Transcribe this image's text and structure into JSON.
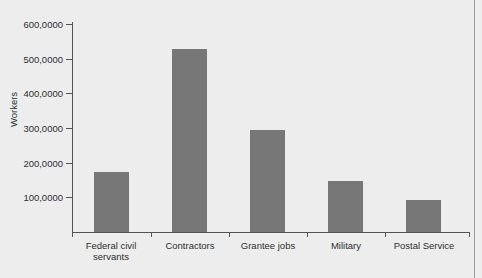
{
  "figure": {
    "background_color": "#ededed",
    "bar_color": "#777777",
    "axis_color": "#555555",
    "clipped_title": "g"
  },
  "axes": {
    "ylabel": "Workers",
    "xlabel": "",
    "ytick_labels": [
      "100,0000",
      "200,0000",
      "300,0000",
      "400,0000",
      "500,0000",
      "600,0000"
    ]
  },
  "chart_data": {
    "type": "bar",
    "title": "",
    "xlabel": "",
    "ylabel": "Workers",
    "categories": [
      "Federal civil servants",
      "Contractors",
      "Grantee jobs",
      "Military",
      "Postal Service"
    ],
    "values": [
      173000,
      527000,
      294000,
      147000,
      92000
    ],
    "ylim": [
      0,
      600000
    ],
    "ytick_values": [
      100000,
      200000,
      300000,
      400000,
      500000,
      600000
    ],
    "ytick_labels": [
      "100,0000",
      "200,0000",
      "300,0000",
      "400,0000",
      "500,0000",
      "600,0000"
    ],
    "grid": false,
    "legend": "none",
    "series": [
      {
        "name": "Workers",
        "values": [
          173000,
          527000,
          294000,
          147000,
          92000
        ]
      }
    ]
  }
}
